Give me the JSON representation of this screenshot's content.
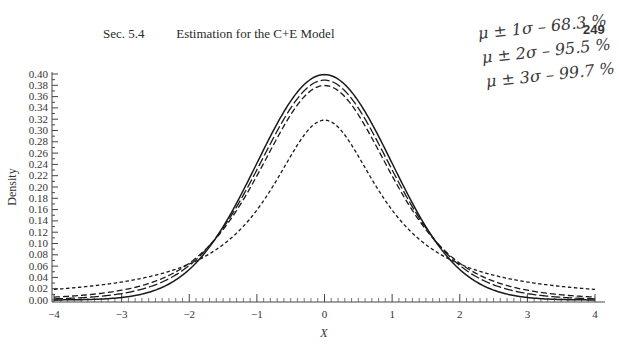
{
  "header": {
    "section": "Sec. 5.4",
    "title": "Estimation for the C+E Model",
    "page_number": "249"
  },
  "annotations": [
    {
      "text": "μ ± 1σ – 68.3 %"
    },
    {
      "text": "μ ± 2σ – 95.5 %"
    },
    {
      "text": "μ ± 3σ – 99.7 %"
    }
  ],
  "chart_data": {
    "type": "line",
    "title": "",
    "xlabel": "X",
    "ylabel": "Density",
    "xlim": [
      -4,
      4
    ],
    "ylim": [
      0,
      0.4
    ],
    "grid": false,
    "legend": "none",
    "x_ticks": [
      "-4",
      "-3",
      "-2",
      "-1",
      "0",
      "1",
      "2",
      "3",
      "4"
    ],
    "y_ticks": [
      "0.00",
      "0.02",
      "0.04",
      "0.06",
      "0.08",
      "0.10",
      "0.12",
      "0.14",
      "0.16",
      "0.18",
      "0.20",
      "0.22",
      "0.24",
      "0.26",
      "0.28",
      "0.30",
      "0.32",
      "0.34",
      "0.36",
      "0.38",
      "0.40"
    ],
    "x": [
      -4,
      -3.5,
      -3,
      -2.5,
      -2,
      -1.5,
      -1,
      -0.5,
      0,
      0.5,
      1,
      1.5,
      2,
      2.5,
      3,
      3.5,
      4
    ],
    "series": [
      {
        "name": "solid (normal)",
        "style": "solid",
        "peak": 0.399,
        "values": [
          0.0001,
          0.0009,
          0.0044,
          0.0175,
          0.054,
          0.1295,
          0.242,
          0.352,
          0.399,
          0.352,
          0.242,
          0.1295,
          0.054,
          0.0175,
          0.0044,
          0.0009,
          0.0001
        ]
      },
      {
        "name": "long dash",
        "style": "long-dash",
        "peak": 0.389,
        "values": [
          0.0028,
          0.0055,
          0.0114,
          0.0269,
          0.0611,
          0.1274,
          0.2304,
          0.3397,
          0.389,
          0.3397,
          0.2304,
          0.1274,
          0.0611,
          0.0269,
          0.0114,
          0.0055,
          0.0028
        ]
      },
      {
        "name": "medium dash",
        "style": "medium-dash",
        "peak": 0.38,
        "values": [
          0.0051,
          0.0087,
          0.0173,
          0.0369,
          0.0651,
          0.1245,
          0.2197,
          0.3279,
          0.38,
          0.3279,
          0.2197,
          0.1245,
          0.0651,
          0.0369,
          0.0173,
          0.0087,
          0.0051
        ]
      },
      {
        "name": "short dash",
        "style": "short-dash",
        "peak": 0.318,
        "values": [
          0.0187,
          0.0241,
          0.0318,
          0.0439,
          0.0637,
          0.0979,
          0.1592,
          0.2546,
          0.3183,
          0.2546,
          0.1592,
          0.0979,
          0.0637,
          0.0439,
          0.0318,
          0.0241,
          0.0187
        ]
      }
    ]
  }
}
